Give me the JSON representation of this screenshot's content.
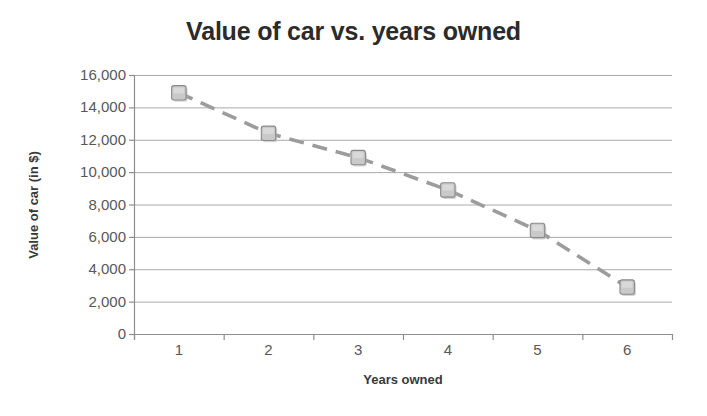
{
  "chart_data": {
    "type": "scatter",
    "title": "Value of car vs. years owned",
    "xlabel": "Years owned",
    "ylabel": "Value of car (in $)",
    "categories": [
      "1",
      "2",
      "3",
      "4",
      "5",
      "6"
    ],
    "x": [
      1,
      2,
      3,
      4,
      5,
      6
    ],
    "values": [
      14900,
      12400,
      10900,
      8900,
      6400,
      2900
    ],
    "series": [
      {
        "name": "Value of car",
        "values": [
          14900,
          12400,
          10900,
          8900,
          6400,
          2900
        ],
        "marker": "square",
        "marker_color": "#c9c9c9",
        "line_style": "dashed",
        "line_color": "#9c9c9c"
      }
    ],
    "ylim": [
      0,
      16000
    ],
    "ytick_labels": [
      "16,000",
      "14,000",
      "12,000",
      "10,000",
      "8,000",
      "6,000",
      "4,000",
      "2,000",
      "0"
    ],
    "ytick_values": [
      16000,
      14000,
      12000,
      10000,
      8000,
      6000,
      4000,
      2000,
      0
    ],
    "xtick_labels": [
      "1",
      "2",
      "3",
      "4",
      "5",
      "6"
    ],
    "grid": "horizontal",
    "legend": "none",
    "background": "#ffffff",
    "title_color": "#2b2b2b",
    "axis_label_color": "#3a3a3a",
    "tick_label_color": "#56585a",
    "gridline_color": "#a9a9a9"
  }
}
